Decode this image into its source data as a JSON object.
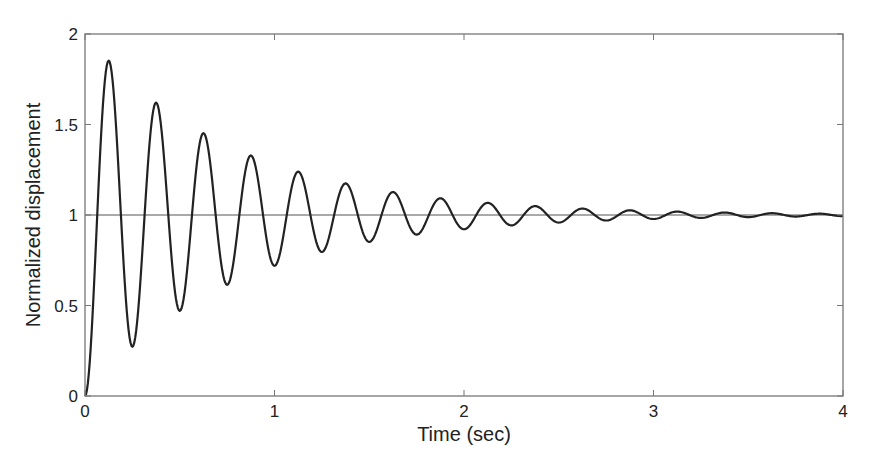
{
  "chart_data": {
    "type": "line",
    "title": "",
    "xlabel": "Time (sec)",
    "ylabel": "Normalized displacement",
    "xlim": [
      0,
      4
    ],
    "ylim": [
      0,
      2
    ],
    "xticks": [
      0,
      1,
      2,
      3,
      4
    ],
    "xtick_labels": [
      "0",
      "1",
      "2",
      "3",
      "4"
    ],
    "yticks": [
      0,
      0.5,
      1,
      1.5,
      2
    ],
    "ytick_labels": [
      "0",
      "0.5",
      "1",
      "1.5",
      "2"
    ],
    "grid": false,
    "legend": null,
    "reference_line": {
      "y": 1,
      "color": "#555555"
    },
    "series": [
      {
        "name": "Step response",
        "color": "#222222",
        "model": {
          "description": "Underdamped 2nd-order unit step response y(t) = 1 - e^(-sigma t)(cos(wd t) + (sigma/wd) sin(wd t))",
          "sigma": 1.27,
          "omega_d": 25.13,
          "sample_step": 0.005
        },
        "key_points": {
          "t": [
            0,
            0.125,
            0.25,
            0.375,
            0.5,
            0.625,
            0.75,
            0.875,
            1.0,
            1.125,
            1.25,
            1.375,
            1.5,
            1.625,
            1.75,
            1.875,
            2.0,
            2.125,
            2.25,
            2.375,
            2.5,
            2.625,
            2.75,
            2.875,
            3.0,
            3.125,
            3.25,
            3.375,
            3.5,
            3.625,
            3.75,
            3.875,
            4.0
          ],
          "y": [
            0,
            1.853,
            0.272,
            1.621,
            0.47,
            1.452,
            0.614,
            1.329,
            0.719,
            1.24,
            0.796,
            1.175,
            0.851,
            1.127,
            0.892,
            1.092,
            0.921,
            1.067,
            0.943,
            1.049,
            0.958,
            1.036,
            0.97,
            1.026,
            0.978,
            1.019,
            0.984,
            1.014,
            0.988,
            1.01,
            0.991,
            1.007,
            0.994
          ]
        }
      }
    ]
  },
  "layout": {
    "plot_left": 85,
    "plot_right": 843,
    "plot_top": 34,
    "plot_bottom": 396
  }
}
